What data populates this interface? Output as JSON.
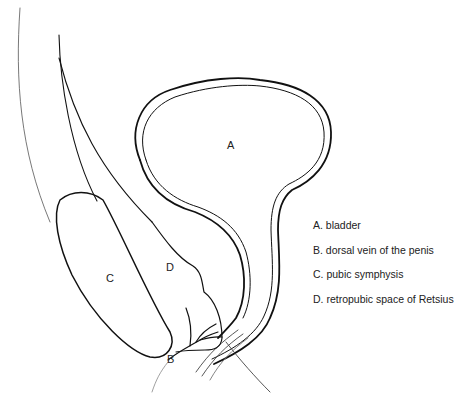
{
  "figure": {
    "type": "anatomical line drawing",
    "labels": {
      "A": "A",
      "B": "B",
      "C": "C",
      "D": "D"
    }
  },
  "legend": {
    "items": [
      {
        "key": "A",
        "text": "A. bladder"
      },
      {
        "key": "B",
        "text": "B. dorsal vein of the penis"
      },
      {
        "key": "C",
        "text": "C. pubic symphysis"
      },
      {
        "key": "D",
        "text": "D. retropubic space of Retsius"
      }
    ]
  },
  "colors": {
    "line": "#111111",
    "background": "#ffffff",
    "text": "#222222"
  }
}
